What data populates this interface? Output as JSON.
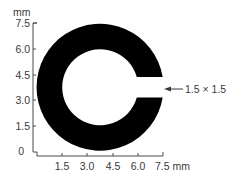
{
  "figure": {
    "shape": {
      "type": "landolt-c-ring",
      "fill_color": "#000000",
      "outer_diameter_mm": 7.5,
      "stroke_width_mm": 1.5,
      "gap_size_mm": 1.5,
      "gap_side": "right"
    },
    "y_axis": {
      "unit_label": "mm",
      "ticks": [
        "0",
        "1.5",
        "3.0",
        "4.5",
        "6.0",
        "7.5"
      ]
    },
    "x_axis": {
      "unit_label": "mm",
      "ticks": [
        "1.5",
        "3.0",
        "4.5",
        "6.0",
        "7.5"
      ],
      "last_tick_with_unit": "7.5 mm"
    },
    "annotation": {
      "label": "1.5 × 1.5",
      "points_to": "gap-opening",
      "arrow_direction": "left"
    }
  }
}
